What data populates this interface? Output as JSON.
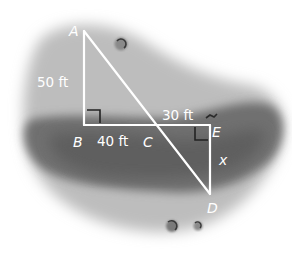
{
  "figure": {
    "points": {
      "A": {
        "label": "A",
        "x": 84,
        "y": 31
      },
      "B": {
        "label": "B",
        "x": 84,
        "y": 125
      },
      "C": {
        "label": "C",
        "x": 157,
        "y": 125
      },
      "E": {
        "label": "E",
        "x": 210,
        "y": 125
      },
      "D": {
        "label": "D",
        "x": 210,
        "y": 194
      }
    },
    "measurements": {
      "AB": "50 ft",
      "BC": "40 ft",
      "CE": "30 ft",
      "ED": "x"
    },
    "right_angles": [
      "B",
      "E"
    ],
    "colors": {
      "line": "#ffffff",
      "pond_light": "#b8b8b8",
      "pond_dark": "#6e6e6e",
      "background": "#ffffff"
    }
  }
}
